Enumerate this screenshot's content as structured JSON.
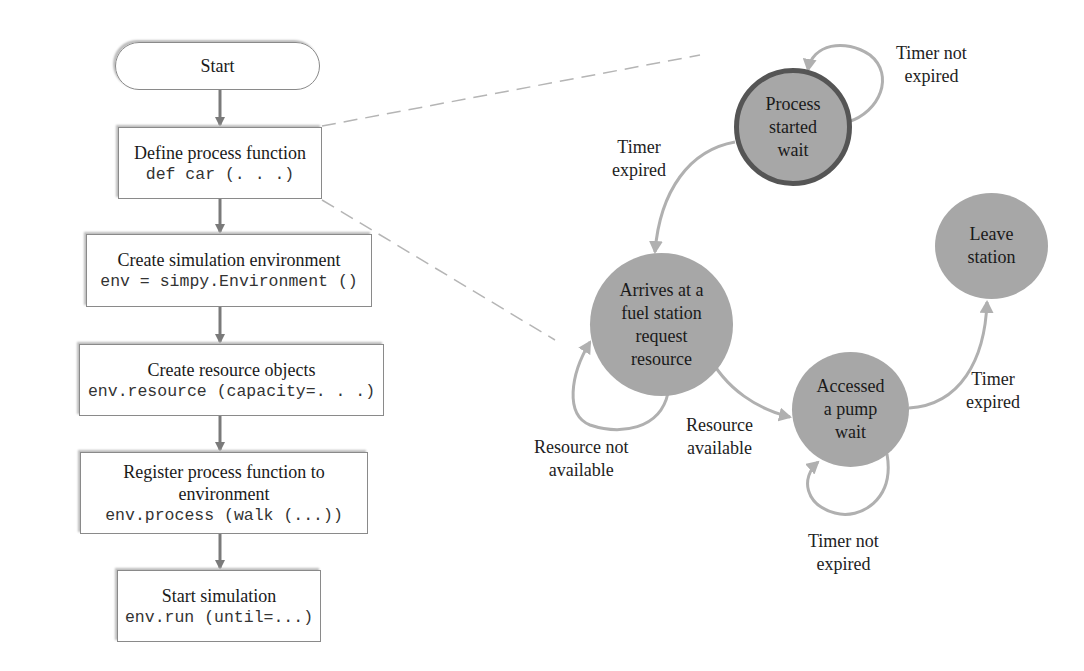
{
  "flowchart": {
    "start": "Start",
    "steps": [
      {
        "title": "Define process function",
        "code": "def car (. . .)"
      },
      {
        "title": "Create simulation environment",
        "code": "env = simpy.Environment ()"
      },
      {
        "title": "Create resource objects",
        "code": "env.resource (capacity=. . .)"
      },
      {
        "title": "Register process function to environment",
        "title_lines": [
          "Register process function to",
          "environment"
        ],
        "code": "env.process (walk (...))"
      },
      {
        "title": "Start simulation",
        "code": "env.run (until=...)"
      }
    ]
  },
  "state_diagram": {
    "states": [
      {
        "id": "process_started",
        "lines": [
          "Process",
          "started",
          "wait"
        ],
        "initial": true
      },
      {
        "id": "arrives",
        "lines": [
          "Arrives at a",
          "fuel station",
          "request",
          "resource"
        ]
      },
      {
        "id": "accessed_pump",
        "lines": [
          "Accessed",
          "a pump",
          "wait"
        ]
      },
      {
        "id": "leave",
        "lines": [
          "Leave",
          "station"
        ]
      }
    ],
    "transitions": [
      {
        "from": "process_started",
        "to": "process_started",
        "label_lines": [
          "Timer not",
          "expired"
        ]
      },
      {
        "from": "process_started",
        "to": "arrives",
        "label_lines": [
          "Timer",
          "expired"
        ]
      },
      {
        "from": "arrives",
        "to": "arrives",
        "label_lines": [
          "Resource not",
          "available"
        ]
      },
      {
        "from": "arrives",
        "to": "accessed_pump",
        "label_lines": [
          "Resource",
          "available"
        ]
      },
      {
        "from": "accessed_pump",
        "to": "accessed_pump",
        "label_lines": [
          "Timer not",
          "expired"
        ]
      },
      {
        "from": "accessed_pump",
        "to": "leave",
        "label_lines": [
          "Timer",
          "expired"
        ]
      }
    ]
  },
  "colors": {
    "node_fill": "#a7a7a7",
    "initial_node_border": "#555555",
    "edge": "#b0b0b0",
    "flow_arrow": "#7a7a7a",
    "dashed_callout": "#b5b5b5"
  }
}
